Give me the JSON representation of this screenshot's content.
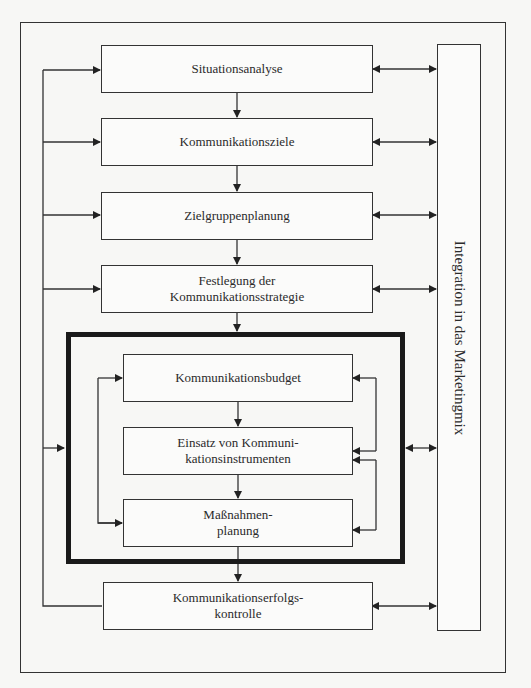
{
  "diagram": {
    "type": "process-flowchart",
    "main_steps": [
      {
        "id": "s1",
        "label": "Situationsanalyse"
      },
      {
        "id": "s2",
        "label": "Kommunikationsziele"
      },
      {
        "id": "s3",
        "label": "Zielgruppenplanung"
      },
      {
        "id": "s4",
        "label": "Festlegung der\nKommunikationsstrategie"
      },
      {
        "id": "s8",
        "label": "Kommunikationserfolgs-\nkontrolle"
      }
    ],
    "inner_group": {
      "steps": [
        {
          "id": "s5",
          "label": "Kommunikationsbudget"
        },
        {
          "id": "s6",
          "label": "Einsatz von Kommuni-\nkationsinstrumenten"
        },
        {
          "id": "s7",
          "label": "Maßnahmen-\nplanung"
        }
      ]
    },
    "side_bar": {
      "label": "Integration in das Marketingmix"
    },
    "edges": [
      {
        "from": "s1",
        "to": "s2",
        "type": "arrow"
      },
      {
        "from": "s2",
        "to": "s3",
        "type": "arrow"
      },
      {
        "from": "s3",
        "to": "s4",
        "type": "arrow"
      },
      {
        "from": "s4",
        "to": "inner_group",
        "type": "arrow"
      },
      {
        "from": "s5",
        "to": "s6",
        "type": "arrow"
      },
      {
        "from": "s6",
        "to": "s7",
        "type": "arrow"
      },
      {
        "from": "inner_group",
        "to": "s8",
        "type": "arrow"
      },
      {
        "from": "s8",
        "to": [
          "s1",
          "s2",
          "s3",
          "s4",
          "inner_group"
        ],
        "type": "feedback"
      },
      {
        "from": "s7",
        "to": "s5",
        "type": "feedback-left"
      },
      {
        "from": "s6",
        "to": "s5",
        "type": "feedback-right"
      },
      {
        "from": "s7",
        "to": "s6",
        "type": "feedback-right"
      },
      {
        "between": [
          "side_bar",
          "s1"
        ],
        "type": "bidirectional"
      },
      {
        "between": [
          "side_bar",
          "s2"
        ],
        "type": "bidirectional"
      },
      {
        "between": [
          "side_bar",
          "s3"
        ],
        "type": "bidirectional"
      },
      {
        "between": [
          "side_bar",
          "s4"
        ],
        "type": "bidirectional"
      },
      {
        "between": [
          "side_bar",
          "inner_group"
        ],
        "type": "bidirectional"
      },
      {
        "between": [
          "side_bar",
          "s8"
        ],
        "type": "bidirectional"
      }
    ]
  }
}
